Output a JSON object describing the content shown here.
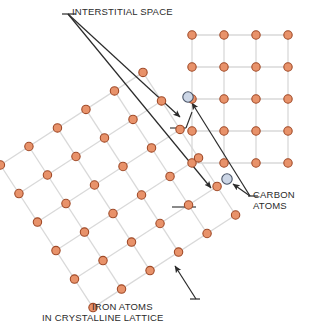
{
  "figure": {
    "width": 312,
    "height": 332,
    "background": "#ffffff"
  },
  "labels": {
    "interstitial": "INTERSTITIAL SPACE",
    "carbon_line1": "CARBON",
    "carbon_line2": "ATOMS",
    "iron_line1": "IRON ATOMS",
    "iron_line2": "IN CRYSTALLINE LATTICE"
  },
  "colors": {
    "iron_fill": "#e8926a",
    "iron_stroke": "#a04a28",
    "carbon_fill": "#ccd6e6",
    "carbon_stroke": "#4a5568",
    "lattice_line": "#d9d9d9",
    "leader_line": "#2b2b2b",
    "text": "#2b2b2b",
    "background": "#ffffff"
  },
  "geometry": {
    "iron_radius": 4.2,
    "carbon_radius": 5.2,
    "lattice_spacing": 32,
    "rotated_lattice_angle_deg": -33
  },
  "lattice_upper_right": {
    "name": "axis-aligned-square-lattice",
    "origin_x": 192,
    "origin_y": 35,
    "cols": 4,
    "rows": 5,
    "spacing": 32
  },
  "lattice_rotated": {
    "name": "rotated-square-lattice",
    "pivot_x": 118,
    "pivot_y": 190,
    "cols": 6,
    "rows": 6,
    "spacing": 34,
    "angle_deg": -33
  },
  "carbon_atoms": [
    {
      "name": "carbon-atom-upper",
      "x": 188,
      "y": 97
    },
    {
      "name": "carbon-atom-lower",
      "x": 227,
      "y": 179
    }
  ],
  "leaders": {
    "interstitial_origin_x": 68,
    "interstitial_origin_y": 14,
    "interstitial_targets": [
      {
        "x": 180,
        "y": 117
      },
      {
        "x": 211,
        "y": 188
      }
    ],
    "carbon_origin_x": 250,
    "carbon_origin_y": 196,
    "carbon_targets": [
      {
        "x": 192,
        "y": 103
      },
      {
        "x": 233,
        "y": 184
      }
    ],
    "iron_origin_x": 196,
    "iron_origin_y": 299,
    "iron_target": {
      "x": 175,
      "y": 266
    }
  }
}
